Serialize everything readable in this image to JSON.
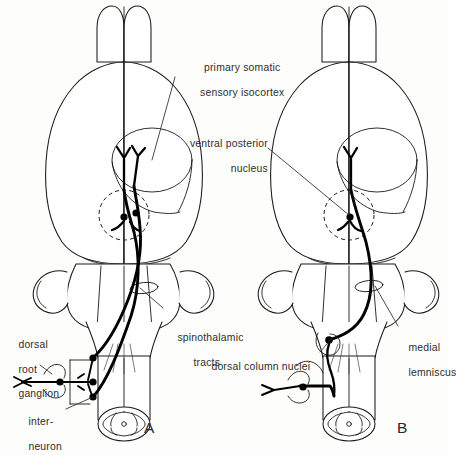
{
  "figure": {
    "background_color": "#fdfdfc",
    "line_color": "#1a1a1a",
    "tract_color": "#000000",
    "text_color": "#2e2e2e"
  },
  "panels": [
    {
      "id": "A",
      "letter": "A",
      "pathway_name": "spinothalamic tracts",
      "neuron_count": 3,
      "thalamic_somas": 2
    },
    {
      "id": "B",
      "letter": "B",
      "pathway_name": "medial lemniscus",
      "neuron_count": 2,
      "thalamic_somas": 1
    }
  ],
  "labels": {
    "primary_cortex": {
      "line1": "primary somatic",
      "line2": "sensory isocortex"
    },
    "ventral_posterior_nucleus": {
      "line1": "ventral posterior",
      "line2": "nucleus"
    },
    "spinothalamic_tracts": {
      "line1": "spinothalamic",
      "line2": "tracts"
    },
    "dorsal_root_ganglion": {
      "line1": "dorsal",
      "line2": "root",
      "line3": "ganglion"
    },
    "interneuron": {
      "line1": "inter-",
      "line2": "neuron"
    },
    "dorsal_column_nuclei": {
      "line1": "dorsal column nuclei"
    },
    "medial_lemniscus": {
      "line1": "medial",
      "line2": "lemniscus"
    }
  }
}
